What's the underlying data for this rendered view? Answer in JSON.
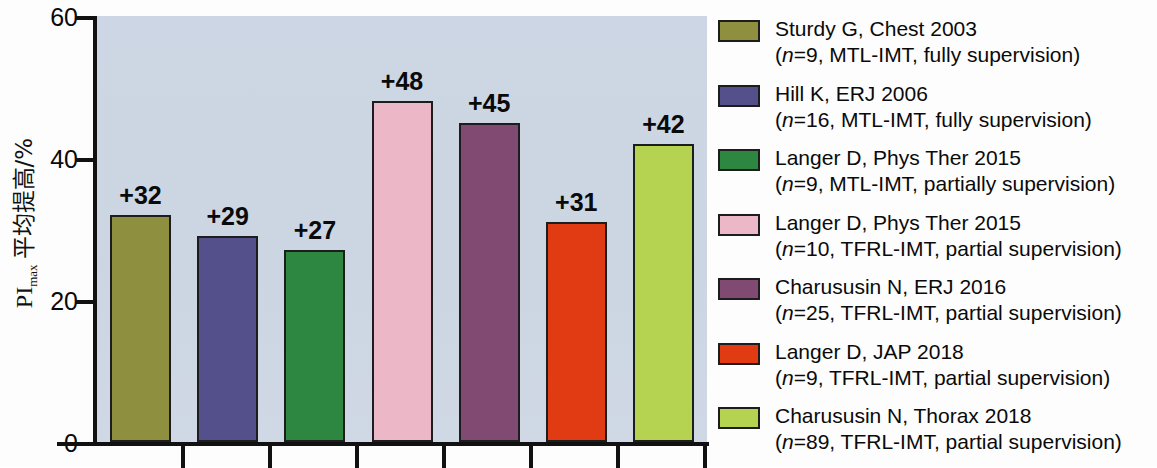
{
  "chart_data": {
    "type": "bar",
    "title": "",
    "subtitle": "",
    "xlabel": "",
    "ylabel": "PImax 平均提高/%",
    "ylabel_parts": {
      "prefix": "PI",
      "subscript": "max",
      "suffix": "平均提高/%"
    },
    "ylim": [
      0,
      60
    ],
    "yticks": [
      0,
      20,
      40,
      60
    ],
    "ytick_labels": [
      "0",
      "20",
      "40",
      "60"
    ],
    "grid": false,
    "legend_position": "right",
    "plot_background": "#ccd6e3",
    "categories": [
      "Sturdy G, Chest 2003",
      "Hill K, ERJ 2006",
      "Langer D, Phys Ther 2015 (MTL-IMT)",
      "Langer D, Phys Ther 2015 (TFRL-IMT)",
      "Charususin N, ERJ 2016",
      "Langer D, JAP 2018",
      "Charususin N, Thorax 2018"
    ],
    "values": [
      32,
      29,
      27,
      48,
      45,
      31,
      42
    ],
    "data_labels": [
      "+32",
      "+29",
      "+27",
      "+48",
      "+45",
      "+31",
      "+42"
    ],
    "colors": [
      "#8e8f3f",
      "#53508c",
      "#2d8740",
      "#ecb8c8",
      "#814a73",
      "#e03b12",
      "#b5d250"
    ],
    "bar_edge_color": "#1d1d1d"
  },
  "legend": {
    "items": [
      {
        "color": "#8e8f3f",
        "line1": "Sturdy G, Chest 2003",
        "line2_pre": "(",
        "line2_italic": "n",
        "line2_post": "=9, MTL-IMT, fully supervision)"
      },
      {
        "color": "#53508c",
        "line1": "Hill K, ERJ 2006",
        "line2_pre": "(",
        "line2_italic": "n",
        "line2_post": "=16, MTL-IMT, fully supervision)"
      },
      {
        "color": "#2d8740",
        "line1": "Langer D, Phys Ther 2015",
        "line2_pre": "(",
        "line2_italic": "n",
        "line2_post": "=9, MTL-IMT, partially supervision)"
      },
      {
        "color": "#ecb8c8",
        "line1": "Langer D, Phys Ther 2015",
        "line2_pre": "(",
        "line2_italic": "n",
        "line2_post": "=10, TFRL-IMT, partial supervision)"
      },
      {
        "color": "#814a73",
        "line1": "Charususin N, ERJ 2016",
        "line2_pre": "(",
        "line2_italic": "n",
        "line2_post": "=25, TFRL-IMT, partial supervision)"
      },
      {
        "color": "#e03b12",
        "line1": "Langer D, JAP 2018",
        "line2_pre": "(",
        "line2_italic": "n",
        "line2_post": "=9, TFRL-IMT, partial supervision)"
      },
      {
        "color": "#b5d250",
        "line1": "Charususin N, Thorax 2018",
        "line2_pre": "(",
        "line2_italic": "n",
        "line2_post": "=89, TFRL-IMT, partial supervision)"
      }
    ]
  }
}
